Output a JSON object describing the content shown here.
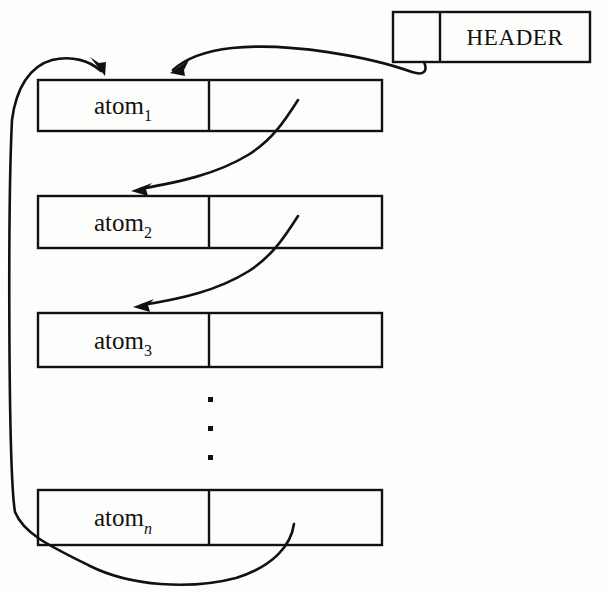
{
  "diagram": {
    "type": "linked-list",
    "background_color": "#fdfdfb",
    "ink_color": "#111111",
    "header": {
      "label": "HEADER",
      "pointer_cell_label": "",
      "box": {
        "x": 393,
        "y": 12,
        "width": 197,
        "height": 50
      },
      "divider_x": 440
    },
    "nodes": [
      {
        "id": "node-1",
        "label": "atom",
        "subscript": "1",
        "subscript_style": "upright",
        "box": {
          "x": 38,
          "y": 80,
          "width": 344,
          "height": 51
        },
        "divider_x": 209
      },
      {
        "id": "node-2",
        "label": "atom",
        "subscript": "2",
        "subscript_style": "upright",
        "box": {
          "x": 38,
          "y": 196,
          "width": 344,
          "height": 52
        },
        "divider_x": 209
      },
      {
        "id": "node-3",
        "label": "atom",
        "subscript": "3",
        "subscript_style": "upright",
        "box": {
          "x": 38,
          "y": 313,
          "width": 344,
          "height": 54
        },
        "divider_x": 209
      },
      {
        "id": "node-n",
        "label": "atom",
        "subscript": "n",
        "subscript_style": "italic",
        "box": {
          "x": 38,
          "y": 490,
          "width": 344,
          "height": 55
        },
        "divider_x": 209
      }
    ],
    "ellipsis": {
      "orientation": "vertical",
      "dot_count": 3,
      "x": 211,
      "ys": [
        400,
        429,
        458
      ]
    },
    "links": [
      {
        "id": "link-header-to-node1",
        "from": "header-pointer-cell",
        "to": "node-1",
        "has_arrowhead": true
      },
      {
        "id": "link-node1-to-node2",
        "from": "node-1-pointer-cell",
        "to": "node-2",
        "has_arrowhead": true
      },
      {
        "id": "link-node2-to-node3",
        "from": "node-2-pointer-cell",
        "to": "node-3",
        "has_arrowhead": true
      },
      {
        "id": "link-noden-to-node1",
        "from": "node-n-pointer-cell",
        "to": "node-1",
        "has_arrowhead": true,
        "note": "circular return link around the left side"
      }
    ]
  }
}
